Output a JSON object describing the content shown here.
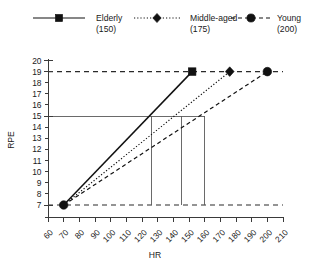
{
  "chart_data": {
    "type": "line",
    "title": "",
    "xlabel": "HR",
    "ylabel": "RPE",
    "xlim": [
      60,
      210
    ],
    "ylim": [
      6,
      20
    ],
    "xticks": [
      60,
      70,
      80,
      90,
      100,
      110,
      120,
      130,
      140,
      150,
      160,
      170,
      180,
      190,
      200,
      210
    ],
    "yticks": [
      6,
      7,
      8,
      9,
      10,
      11,
      12,
      13,
      14,
      15,
      16,
      17,
      18,
      19,
      20
    ],
    "ytick_labels_shown": [
      20,
      19,
      18,
      17,
      16,
      15,
      14,
      13,
      12,
      11,
      10,
      9,
      8,
      7
    ],
    "grid": false,
    "legend_position": "top",
    "series": [
      {
        "name": "Elderly",
        "group_label": "Elderly",
        "max_hr_label": "(150)",
        "max_hr": 150,
        "marker": "square",
        "line_style": "solid",
        "x": [
          70,
          152
        ],
        "y": [
          7,
          19
        ]
      },
      {
        "name": "Middle-aged",
        "group_label": "Middle-aged",
        "max_hr_label": "(175)",
        "max_hr": 175,
        "marker": "diamond",
        "line_style": "dotted",
        "x": [
          70,
          176
        ],
        "y": [
          7,
          19
        ]
      },
      {
        "name": "Young",
        "group_label": "Young",
        "max_hr_label": "(200)",
        "max_hr": 200,
        "marker": "circle",
        "line_style": "dashed",
        "x": [
          70,
          200
        ],
        "y": [
          7,
          19
        ]
      }
    ],
    "reference_lines": [
      {
        "name": "rpe-19-dashed",
        "orientation": "horizontal",
        "value": 19,
        "style": "dashed",
        "from_x": 60,
        "to_x": 210
      },
      {
        "name": "rpe-7-dashed",
        "orientation": "horizontal",
        "value": 7,
        "style": "dashed",
        "from_x": 60,
        "to_x": 210
      },
      {
        "name": "rpe-15-solid",
        "orientation": "horizontal",
        "value": 15,
        "style": "solid",
        "from_x": 60,
        "to_x": 160
      },
      {
        "name": "drop-elderly",
        "orientation": "vertical",
        "value": 126,
        "style": "solid",
        "from_y": 7,
        "to_y": 15
      },
      {
        "name": "drop-middle-aged",
        "orientation": "vertical",
        "value": 145,
        "style": "solid",
        "from_y": 7,
        "to_y": 15
      },
      {
        "name": "drop-young",
        "orientation": "vertical",
        "value": 160,
        "style": "solid",
        "from_y": 7,
        "to_y": 15
      }
    ]
  },
  "legend": {
    "entries": [
      {
        "label": "Elderly",
        "sublabel": "(150)",
        "marker": "square-marker-icon",
        "line_style": "solid"
      },
      {
        "label": "Middle-aged",
        "sublabel": "(175)",
        "marker": "diamond-marker-icon",
        "line_style": "dotted"
      },
      {
        "label": "Young",
        "sublabel": "(200)",
        "marker": "circle-marker-icon",
        "line_style": "dashed"
      }
    ]
  },
  "axes": {
    "y_title": "RPE",
    "x_title": "HR"
  },
  "colors": {
    "ink": "#111111",
    "axis": "#3a3a3a",
    "reference": "#5a5a5a",
    "background": "#ffffff"
  }
}
